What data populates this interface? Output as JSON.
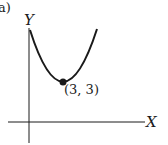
{
  "figure": {
    "panel_label": "a)",
    "x_axis_label": "X",
    "y_axis_label": "Y",
    "point_label": "(3, 3)",
    "curve_type": "parabola",
    "vertex": {
      "x": 3,
      "y": 3
    },
    "colors": {
      "stroke": "#1a1a1a",
      "background": "#ffffff"
    }
  }
}
